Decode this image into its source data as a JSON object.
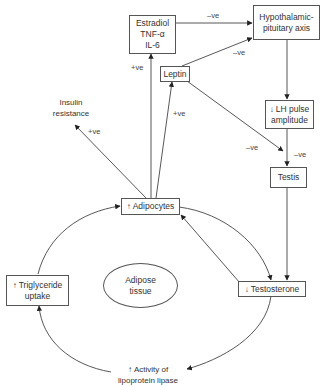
{
  "nodes": {
    "estradiol": {
      "lines": [
        "Estradiol",
        "TNF-α",
        "IL-6"
      ]
    },
    "hpa": {
      "lines": [
        "Hypothalamic-",
        "pituitary axis"
      ]
    },
    "leptin": {
      "label": "Leptin"
    },
    "lh": {
      "arrow": "↓",
      "lines": [
        "LH pulse",
        "amplitude"
      ]
    },
    "testis": {
      "label": "Testis"
    },
    "adipocytes": {
      "arrow": "↑",
      "label": "Adipocytes"
    },
    "triglyceride": {
      "arrow": "↑",
      "lines": [
        "Triglyceride",
        "uptake"
      ]
    },
    "adipose_tissue": {
      "lines": [
        "Adipose",
        "tissue"
      ]
    },
    "testosterone": {
      "arrow": "↓",
      "label": "Testosterone"
    },
    "lipase": {
      "arrow": "↑",
      "lines": [
        "Activity of",
        "lipoprotein lipase"
      ]
    },
    "insulin": {
      "lines": [
        "Insulin",
        "resistance"
      ]
    }
  },
  "edge_labels": {
    "estradiol_to_hpa": "–ve",
    "leptin_to_hpa": "–ve",
    "adipocytes_to_estradiol": "+ve",
    "adipocytes_to_leptin": "+ve",
    "adipocytes_to_insulin": "+ve",
    "leptin_to_testis": "–ve",
    "lh_to_testis": "–ve"
  },
  "colors": {
    "line": "#444444",
    "box_border": "#555555",
    "text": "#333333"
  }
}
